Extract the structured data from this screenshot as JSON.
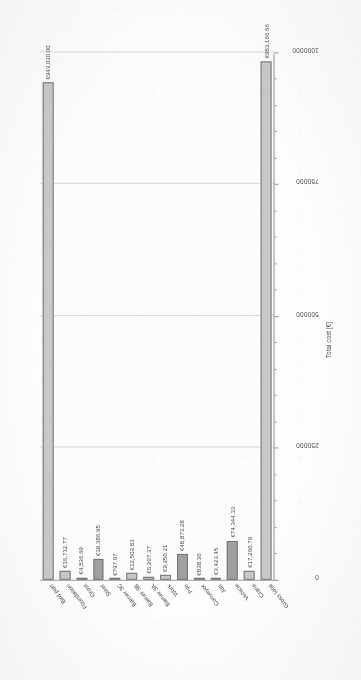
{
  "chart_data": {
    "type": "bar",
    "orientation": "horizontal",
    "title": "",
    "xlabel": "Total cost [€]",
    "ylabel": "",
    "xlim": [
      0,
      1000000
    ],
    "grid": true,
    "legend": false,
    "xticks": [
      0,
      250000,
      500000,
      750000,
      1000000
    ],
    "xticklabels": [
      "0",
      "250000",
      "500000",
      "750000",
      "1000000"
    ],
    "categories": [
      "Bird port",
      "Foundation",
      "Grout",
      "Steel",
      "Barrier 3C",
      "Barrier 3B",
      "Barrier 3A",
      "Work",
      "Pile",
      "Conveyor",
      "Job",
      "Vehicle",
      "Crane",
      "Gross total"
    ],
    "values": [
      943030.0,
      16712.77,
      4536.69,
      39386.95,
      797.97,
      12502.83,
      6207.37,
      9250.21,
      48873.28,
      838.36,
      3423.45,
      74344.33,
      17260.79,
      983166.66
    ],
    "value_labels": [
      "€943,030.00",
      "€16,712.77",
      "€4,536.69",
      "€39,386.95",
      "€797.97",
      "€12,502.83",
      "€6,207.37",
      "€9,250.21",
      "€48,873.28",
      "€838.36",
      "€3,423.45",
      "€74,344.33",
      "€17,260.79",
      "€983,166.66"
    ],
    "bar_shades": [
      "light",
      "light",
      "light",
      "dark",
      "light",
      "light",
      "light",
      "light",
      "dark",
      "light",
      "light",
      "dark",
      "light",
      "light"
    ],
    "colors": {
      "bar_light": "#c8c8c8",
      "bar_dark": "#9e9e9e",
      "bar_edge": "#707070",
      "gridline": "#d8d8d8",
      "axis": "#8d8d8d",
      "text": "#3f3f3f"
    }
  }
}
